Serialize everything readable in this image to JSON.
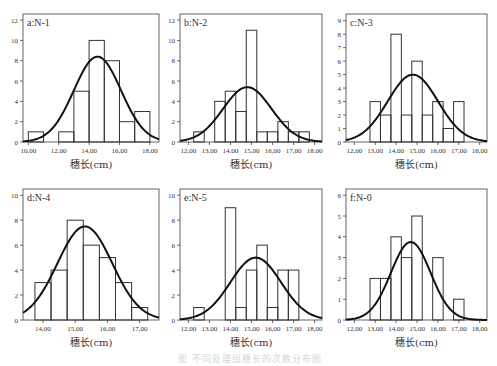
{
  "figure": {
    "caption": "图  不同处理组穗长的次数分布图"
  },
  "chart_data": [
    {
      "type": "bar",
      "panel": "a",
      "title": "a:N-1",
      "xlabel": "穗长(cm)",
      "ylabel": "",
      "xlim": [
        9.65,
        18.6
      ],
      "ylim": [
        0,
        12.6
      ],
      "xticks": [
        10,
        12,
        14,
        16,
        18
      ],
      "xtick_labels": [
        "10,00",
        "12,00",
        "14,00",
        "16,00",
        "18,00"
      ],
      "yticks": [
        0,
        2,
        4,
        6,
        8,
        10,
        12
      ],
      "bin_edges": [
        10,
        11,
        12,
        13,
        14,
        15,
        16,
        17,
        18
      ],
      "values": [
        1,
        0,
        1,
        5,
        10,
        8,
        2,
        3
      ],
      "normal_curve": {
        "mean": 14.55,
        "sd": 1.55,
        "peak": 8.4
      },
      "frame": {
        "x": 23,
        "y": 14,
        "w": 136,
        "h": 128
      }
    },
    {
      "type": "bar",
      "panel": "b",
      "title": "b:N-2",
      "xlabel": "穗长(cm)",
      "ylabel": "",
      "xlim": [
        11.6,
        18.35
      ],
      "ylim": [
        0,
        12.6
      ],
      "xticks": [
        12,
        13,
        14,
        15,
        16,
        17,
        18
      ],
      "xtick_labels": [
        "12,00",
        "13,00",
        "14,00",
        "15,00",
        "16,00",
        "17,00",
        "18,00"
      ],
      "yticks": [
        0,
        2,
        4,
        6,
        8,
        10,
        12
      ],
      "bin_edges": [
        12.25,
        12.75,
        13.25,
        13.75,
        14.25,
        14.75,
        15.25,
        15.75,
        16.25,
        16.75,
        17.25,
        17.75
      ],
      "values": [
        1,
        0,
        4,
        5,
        3,
        11,
        1,
        1,
        2,
        1,
        1
      ],
      "normal_curve": {
        "mean": 14.8,
        "sd": 1.15,
        "peak": 5.4
      },
      "frame": {
        "x": 180,
        "y": 14,
        "w": 142,
        "h": 128
      }
    },
    {
      "type": "bar",
      "panel": "c",
      "title": "c:N-3",
      "xlabel": "穗长(cm)",
      "ylabel": "",
      "xlim": [
        11.6,
        18.35
      ],
      "ylim": [
        0,
        9.5
      ],
      "xticks": [
        12,
        13,
        14,
        15,
        16,
        17,
        18
      ],
      "xtick_labels": [
        "12,00",
        "13,00",
        "14,00",
        "15,00",
        "16,00",
        "17,00",
        "18,00"
      ],
      "yticks": [
        0,
        1,
        2,
        3,
        4,
        5,
        6,
        7,
        8,
        9
      ],
      "bin_edges": [
        12.75,
        13.25,
        13.75,
        14.25,
        14.75,
        15.25,
        15.75,
        16.25,
        16.75,
        17.25
      ],
      "values": [
        3,
        2,
        8,
        2,
        6,
        2,
        3,
        1,
        3
      ],
      "normal_curve": {
        "mean": 14.8,
        "sd": 1.2,
        "peak": 5.0
      },
      "frame": {
        "x": 346,
        "y": 14,
        "w": 141,
        "h": 128
      }
    },
    {
      "type": "bar",
      "panel": "d",
      "title": "d:N-4",
      "xlabel": "穗长(cm)",
      "ylabel": "",
      "xlim": [
        13.38,
        17.6
      ],
      "ylim": [
        0,
        10.5
      ],
      "xticks": [
        14,
        15,
        16,
        17
      ],
      "xtick_labels": [
        "14,00",
        "15,00",
        "16,00",
        "17,00"
      ],
      "yticks": [
        0,
        2,
        4,
        6,
        8,
        10
      ],
      "bin_edges": [
        13.75,
        14.25,
        14.75,
        15.25,
        15.75,
        16.25,
        16.75,
        17.25
      ],
      "values": [
        3,
        4,
        8,
        6,
        5,
        3,
        1
      ],
      "normal_curve": {
        "mean": 15.3,
        "sd": 0.85,
        "peak": 7.5
      },
      "frame": {
        "x": 23,
        "y": 189,
        "w": 136,
        "h": 131
      }
    },
    {
      "type": "bar",
      "panel": "e",
      "title": "e:N-5",
      "xlabel": "穗长(cm)",
      "ylabel": "",
      "xlim": [
        11.6,
        18.35
      ],
      "ylim": [
        0,
        10.5
      ],
      "xticks": [
        12,
        13,
        14,
        15,
        16,
        17,
        18
      ],
      "xtick_labels": [
        "12,00",
        "13,00",
        "14,00",
        "15,00",
        "16,00",
        "17,00",
        "18,00"
      ],
      "yticks": [
        0,
        2,
        4,
        6,
        8,
        10
      ],
      "bin_edges": [
        12.25,
        12.75,
        13.25,
        13.75,
        14.25,
        14.75,
        15.25,
        15.75,
        16.25,
        16.75,
        17.25
      ],
      "values": [
        1,
        0,
        0,
        9,
        1,
        4,
        6,
        1,
        4,
        4
      ],
      "normal_curve": {
        "mean": 15.2,
        "sd": 1.2,
        "peak": 5.0
      },
      "frame": {
        "x": 180,
        "y": 189,
        "w": 142,
        "h": 131
      }
    },
    {
      "type": "bar",
      "panel": "f",
      "title": "f:N-0",
      "xlabel": "穗长(cm)",
      "ylabel": "",
      "xlim": [
        11.6,
        18.35
      ],
      "ylim": [
        0,
        6.3
      ],
      "xticks": [
        12,
        13,
        14,
        15,
        16,
        17,
        18
      ],
      "xtick_labels": [
        "12,00",
        "13,00",
        "14,00",
        "15,00",
        "16,00",
        "17,00",
        "18,00"
      ],
      "yticks": [
        0,
        1,
        2,
        3,
        4,
        5,
        6
      ],
      "bin_edges": [
        12.75,
        13.25,
        13.75,
        14.25,
        14.75,
        15.25,
        15.75,
        16.25,
        16.75,
        17.25
      ],
      "values": [
        2,
        2,
        4,
        3,
        5,
        0,
        3,
        0,
        1
      ],
      "normal_curve": {
        "mean": 14.7,
        "sd": 0.95,
        "peak": 3.75
      },
      "frame": {
        "x": 346,
        "y": 189,
        "w": 141,
        "h": 131
      }
    }
  ]
}
